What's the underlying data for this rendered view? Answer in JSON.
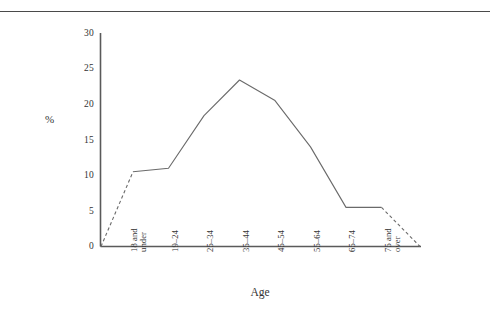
{
  "page": {
    "has_top_rule": true,
    "background": "#ffffff",
    "ink_color": "#555555"
  },
  "chart_data": {
    "type": "line",
    "title": "",
    "xlabel": "Age",
    "ylabel": "%",
    "categories": [
      "18 and under",
      "19–24",
      "25–34",
      "35–44",
      "45–54",
      "55–64",
      "65–74",
      "75 and over"
    ],
    "category_lines": [
      [
        "18 and",
        "under"
      ],
      [
        "19–24"
      ],
      [
        "25–34"
      ],
      [
        "35–44"
      ],
      [
        "45–54"
      ],
      [
        "55–64"
      ],
      [
        "65–74"
      ],
      [
        "75 and",
        "over"
      ]
    ],
    "values": [
      10.5,
      11.0,
      18.4,
      23.4,
      20.5,
      14.0,
      5.5,
      5.5
    ],
    "series": [
      {
        "name": "Percent of group",
        "values": [
          10.5,
          11.0,
          18.4,
          23.4,
          20.5,
          14.0,
          5.5,
          5.5
        ]
      }
    ],
    "ylim": [
      0,
      30
    ],
    "yticks": [
      0,
      5,
      10,
      15,
      20,
      25,
      30
    ],
    "ytick_labels": [
      "0",
      "5",
      "10",
      "15",
      "20",
      "25",
      "30"
    ],
    "xlim_note": "axis extends one half-step beyond first and last category",
    "grid": false,
    "legend": "none",
    "line_style": "solid between categories, dashed extrapolation to zero at both ends",
    "dashed_segments": [
      {
        "from": {
          "x": "axis-origin",
          "y": 0
        },
        "to": {
          "category": "18 and under",
          "y": 10.5
        }
      },
      {
        "from": {
          "category": "75 and over",
          "y": 5.5
        },
        "to": {
          "x": "axis-end",
          "y": 0
        }
      }
    ],
    "markers": "none",
    "line_color": "#555555"
  }
}
